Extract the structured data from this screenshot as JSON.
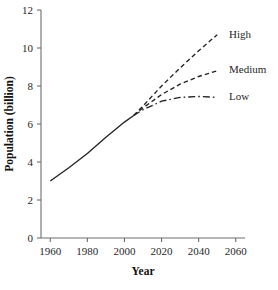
{
  "chart_data": {
    "type": "line",
    "title": "",
    "xlabel": "Year",
    "ylabel": "Population (billion)",
    "xlim": [
      1955,
      2065
    ],
    "ylim": [
      0,
      12
    ],
    "xticks": [
      1960,
      1980,
      2000,
      2020,
      2040,
      2060
    ],
    "yticks": [
      0,
      2,
      4,
      6,
      8,
      10,
      12
    ],
    "grid": false,
    "legend_position": "right-inline-labels",
    "series": [
      {
        "name": "Historical",
        "style": "solid",
        "label": "",
        "x": [
          1960,
          1970,
          1980,
          1990,
          2000,
          2005
        ],
        "values": [
          3.0,
          3.7,
          4.45,
          5.3,
          6.1,
          6.45
        ]
      },
      {
        "name": "High",
        "style": "dashed",
        "label": "High",
        "x": [
          2005,
          2010,
          2020,
          2030,
          2040,
          2050
        ],
        "values": [
          6.45,
          6.95,
          8.0,
          8.95,
          9.85,
          10.7
        ]
      },
      {
        "name": "Medium",
        "style": "dashed",
        "label": "Medium",
        "x": [
          2005,
          2010,
          2020,
          2030,
          2040,
          2050
        ],
        "values": [
          6.45,
          6.85,
          7.55,
          8.1,
          8.5,
          8.8
        ]
      },
      {
        "name": "Low",
        "style": "dash-dot",
        "label": "Low",
        "x": [
          2005,
          2010,
          2020,
          2030,
          2040,
          2050
        ],
        "values": [
          6.45,
          6.75,
          7.2,
          7.4,
          7.45,
          7.4
        ]
      }
    ],
    "annotations": [
      "High",
      "Medium",
      "Low"
    ]
  },
  "axes": {
    "x_title": "Year",
    "y_title": "Population (billion)",
    "x_tick_labels": [
      "1960",
      "1980",
      "2000",
      "2020",
      "2040",
      "2060"
    ],
    "y_tick_labels": [
      "0",
      "2",
      "4",
      "6",
      "8",
      "10",
      "12"
    ]
  },
  "labels": {
    "high": "High",
    "medium": "Medium",
    "low": "Low"
  },
  "colors": {
    "line": "#232323",
    "axis": "#6e6e6e",
    "text": "#1f1f1f",
    "background": "#ffffff"
  },
  "caption_sliver": ""
}
